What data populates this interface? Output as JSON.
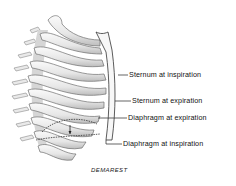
{
  "diagram": {
    "labels": [
      {
        "id": "sternum-inspiration",
        "text": "Sternum at inspiration",
        "x": 129,
        "y": 70
      },
      {
        "id": "sternum-expiration",
        "text": "Sternum at expiration",
        "x": 132,
        "y": 96
      },
      {
        "id": "diaphragm-expiration",
        "text": "Diaphragm at expiration",
        "x": 128,
        "y": 113
      },
      {
        "id": "diaphragm-inspiration",
        "text": "Diaphragm at inspiration",
        "x": 123,
        "y": 139
      }
    ],
    "signature": "DEMAREST",
    "colors": {
      "bone_fill": "#efefef",
      "bone_shadow": "#bdbdbd",
      "outline": "#555555",
      "line": "#222222"
    }
  }
}
